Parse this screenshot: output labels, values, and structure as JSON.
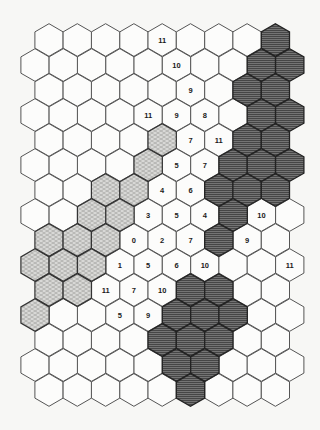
{
  "board": {
    "title": "",
    "geometry": {
      "orientation": "pointy-top",
      "rows": 15,
      "even_row_count": 9,
      "odd_row_count": 10,
      "even_row_x0": 49,
      "odd_row_x0": 35,
      "col_spacing": 28.3,
      "row_y0": 40,
      "row_spacing": 25,
      "hex_radius": 16.3
    },
    "colors": {
      "blank_fill": "#fcfcfb",
      "light_fill": "#d8d8d6",
      "light_hatch": "#8a8a88",
      "dark_fill": "#6e6e6e",
      "dark_hatch": "#3a3a3a",
      "outline": "#555555",
      "label": "#1a1a1a"
    },
    "legend": {
      "blank": "open hex",
      "light": "light-hatched region",
      "dark": "dark-hatched region"
    },
    "cells": [
      {
        "row": 0,
        "col": 4,
        "fill": "blank",
        "label": "11"
      },
      {
        "row": 0,
        "col": 8,
        "fill": "dark",
        "label": ""
      },
      {
        "row": 1,
        "col": 5,
        "fill": "blank",
        "label": "10"
      },
      {
        "row": 1,
        "col": 8,
        "fill": "dark",
        "label": ""
      },
      {
        "row": 1,
        "col": 9,
        "fill": "dark",
        "label": ""
      },
      {
        "row": 2,
        "col": 5,
        "fill": "blank",
        "label": "9"
      },
      {
        "row": 2,
        "col": 7,
        "fill": "dark",
        "label": ""
      },
      {
        "row": 2,
        "col": 8,
        "fill": "dark",
        "label": ""
      },
      {
        "row": 3,
        "col": 4,
        "fill": "blank",
        "label": "11"
      },
      {
        "row": 3,
        "col": 5,
        "fill": "blank",
        "label": "9"
      },
      {
        "row": 3,
        "col": 6,
        "fill": "blank",
        "label": "8"
      },
      {
        "row": 3,
        "col": 8,
        "fill": "dark",
        "label": ""
      },
      {
        "row": 3,
        "col": 9,
        "fill": "dark",
        "label": ""
      },
      {
        "row": 4,
        "col": 4,
        "fill": "light",
        "label": ""
      },
      {
        "row": 4,
        "col": 5,
        "fill": "blank",
        "label": "7"
      },
      {
        "row": 4,
        "col": 6,
        "fill": "blank",
        "label": "11"
      },
      {
        "row": 4,
        "col": 7,
        "fill": "dark",
        "label": ""
      },
      {
        "row": 4,
        "col": 8,
        "fill": "dark",
        "label": ""
      },
      {
        "row": 5,
        "col": 4,
        "fill": "light",
        "label": ""
      },
      {
        "row": 5,
        "col": 5,
        "fill": "blank",
        "label": "5"
      },
      {
        "row": 5,
        "col": 6,
        "fill": "blank",
        "label": "7"
      },
      {
        "row": 5,
        "col": 7,
        "fill": "dark",
        "label": ""
      },
      {
        "row": 5,
        "col": 8,
        "fill": "dark",
        "label": ""
      },
      {
        "row": 5,
        "col": 9,
        "fill": "dark",
        "label": ""
      },
      {
        "row": 6,
        "col": 2,
        "fill": "light",
        "label": ""
      },
      {
        "row": 6,
        "col": 3,
        "fill": "light",
        "label": ""
      },
      {
        "row": 6,
        "col": 4,
        "fill": "blank",
        "label": "4"
      },
      {
        "row": 6,
        "col": 5,
        "fill": "blank",
        "label": "6"
      },
      {
        "row": 6,
        "col": 6,
        "fill": "dark",
        "label": ""
      },
      {
        "row": 6,
        "col": 7,
        "fill": "dark",
        "label": ""
      },
      {
        "row": 6,
        "col": 8,
        "fill": "dark",
        "label": ""
      },
      {
        "row": 7,
        "col": 2,
        "fill": "light",
        "label": ""
      },
      {
        "row": 7,
        "col": 3,
        "fill": "light",
        "label": ""
      },
      {
        "row": 7,
        "col": 4,
        "fill": "blank",
        "label": "3"
      },
      {
        "row": 7,
        "col": 5,
        "fill": "blank",
        "label": "5"
      },
      {
        "row": 7,
        "col": 6,
        "fill": "blank",
        "label": "4"
      },
      {
        "row": 7,
        "col": 7,
        "fill": "dark",
        "label": ""
      },
      {
        "row": 7,
        "col": 8,
        "fill": "blank",
        "label": "10"
      },
      {
        "row": 8,
        "col": 0,
        "fill": "light",
        "label": ""
      },
      {
        "row": 8,
        "col": 1,
        "fill": "light",
        "label": ""
      },
      {
        "row": 8,
        "col": 2,
        "fill": "light",
        "label": ""
      },
      {
        "row": 8,
        "col": 3,
        "fill": "blank",
        "label": "0"
      },
      {
        "row": 8,
        "col": 4,
        "fill": "blank",
        "label": "2"
      },
      {
        "row": 8,
        "col": 5,
        "fill": "blank",
        "label": "7"
      },
      {
        "row": 8,
        "col": 6,
        "fill": "dark",
        "label": ""
      },
      {
        "row": 8,
        "col": 7,
        "fill": "blank",
        "label": "9"
      },
      {
        "row": 9,
        "col": 0,
        "fill": "light",
        "label": ""
      },
      {
        "row": 9,
        "col": 1,
        "fill": "light",
        "label": ""
      },
      {
        "row": 9,
        "col": 2,
        "fill": "light",
        "label": ""
      },
      {
        "row": 9,
        "col": 3,
        "fill": "blank",
        "label": "1"
      },
      {
        "row": 9,
        "col": 4,
        "fill": "blank",
        "label": "5"
      },
      {
        "row": 9,
        "col": 5,
        "fill": "blank",
        "label": "6"
      },
      {
        "row": 9,
        "col": 6,
        "fill": "blank",
        "label": "10"
      },
      {
        "row": 9,
        "col": 9,
        "fill": "blank",
        "label": "11"
      },
      {
        "row": 10,
        "col": 0,
        "fill": "light",
        "label": ""
      },
      {
        "row": 10,
        "col": 1,
        "fill": "light",
        "label": ""
      },
      {
        "row": 10,
        "col": 2,
        "fill": "blank",
        "label": "11"
      },
      {
        "row": 10,
        "col": 3,
        "fill": "blank",
        "label": "7"
      },
      {
        "row": 10,
        "col": 4,
        "fill": "blank",
        "label": "10"
      },
      {
        "row": 10,
        "col": 5,
        "fill": "dark",
        "label": ""
      },
      {
        "row": 10,
        "col": 6,
        "fill": "dark",
        "label": ""
      },
      {
        "row": 11,
        "col": 0,
        "fill": "light",
        "label": ""
      },
      {
        "row": 11,
        "col": 3,
        "fill": "blank",
        "label": "5"
      },
      {
        "row": 11,
        "col": 4,
        "fill": "blank",
        "label": "9"
      },
      {
        "row": 11,
        "col": 5,
        "fill": "dark",
        "label": ""
      },
      {
        "row": 11,
        "col": 6,
        "fill": "dark",
        "label": ""
      },
      {
        "row": 11,
        "col": 7,
        "fill": "dark",
        "label": ""
      },
      {
        "row": 12,
        "col": 4,
        "fill": "dark",
        "label": ""
      },
      {
        "row": 12,
        "col": 5,
        "fill": "dark",
        "label": ""
      },
      {
        "row": 12,
        "col": 6,
        "fill": "dark",
        "label": ""
      },
      {
        "row": 13,
        "col": 5,
        "fill": "dark",
        "label": ""
      },
      {
        "row": 13,
        "col": 6,
        "fill": "dark",
        "label": ""
      },
      {
        "row": 14,
        "col": 5,
        "fill": "dark",
        "label": ""
      }
    ]
  }
}
